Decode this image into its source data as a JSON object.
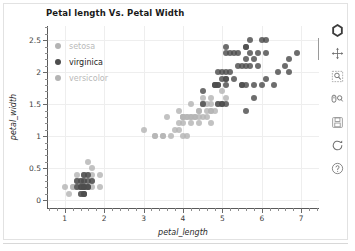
{
  "chart_data": {
    "type": "scatter",
    "title": "Petal length Vs. Petal Width",
    "xlabel": "petal_length",
    "ylabel": "petal_width",
    "xlim": [
      0.55,
      7.45
    ],
    "ylim": [
      -0.12,
      2.72
    ],
    "xticks": [
      1,
      2,
      3,
      4,
      5,
      6,
      7
    ],
    "yticks": [
      0,
      0.5,
      1,
      1.5,
      2,
      2.5
    ],
    "xticklabels": [
      "1",
      "2",
      "3",
      "4",
      "5",
      "6",
      "7"
    ],
    "yticklabels": [
      "0",
      "0.5",
      "1",
      "1.5",
      "2",
      "2.5"
    ],
    "grid": true,
    "legend_position": "upper-left",
    "series": [
      {
        "name": "setosa",
        "color": "#b4b4b4",
        "points": [
          [
            1.4,
            0.2
          ],
          [
            1.4,
            0.2
          ],
          [
            1.3,
            0.2
          ],
          [
            1.5,
            0.2
          ],
          [
            1.4,
            0.2
          ],
          [
            1.7,
            0.4
          ],
          [
            1.4,
            0.3
          ],
          [
            1.5,
            0.2
          ],
          [
            1.4,
            0.2
          ],
          [
            1.5,
            0.1
          ],
          [
            1.5,
            0.2
          ],
          [
            1.6,
            0.2
          ],
          [
            1.4,
            0.1
          ],
          [
            1.1,
            0.1
          ],
          [
            1.2,
            0.2
          ],
          [
            1.5,
            0.4
          ],
          [
            1.3,
            0.4
          ],
          [
            1.4,
            0.3
          ],
          [
            1.7,
            0.3
          ],
          [
            1.5,
            0.3
          ],
          [
            1.7,
            0.2
          ],
          [
            1.5,
            0.4
          ],
          [
            1.0,
            0.2
          ],
          [
            1.7,
            0.5
          ],
          [
            1.9,
            0.2
          ],
          [
            1.6,
            0.2
          ],
          [
            1.6,
            0.4
          ],
          [
            1.5,
            0.2
          ],
          [
            1.4,
            0.2
          ],
          [
            1.6,
            0.2
          ],
          [
            1.6,
            0.2
          ],
          [
            1.5,
            0.4
          ],
          [
            1.5,
            0.1
          ],
          [
            1.4,
            0.2
          ],
          [
            1.5,
            0.2
          ],
          [
            1.2,
            0.2
          ],
          [
            1.3,
            0.2
          ],
          [
            1.4,
            0.1
          ],
          [
            1.3,
            0.2
          ],
          [
            1.5,
            0.2
          ],
          [
            1.3,
            0.3
          ],
          [
            1.3,
            0.3
          ],
          [
            1.3,
            0.2
          ],
          [
            1.6,
            0.6
          ],
          [
            1.9,
            0.4
          ],
          [
            1.4,
            0.3
          ],
          [
            1.6,
            0.2
          ],
          [
            1.4,
            0.2
          ],
          [
            1.5,
            0.2
          ],
          [
            1.4,
            0.2
          ]
        ]
      },
      {
        "name": "versicolor",
        "color": "#b4b4b4",
        "points": [
          [
            4.7,
            1.4
          ],
          [
            4.5,
            1.5
          ],
          [
            4.9,
            1.5
          ],
          [
            4.0,
            1.3
          ],
          [
            4.6,
            1.5
          ],
          [
            4.5,
            1.3
          ],
          [
            4.7,
            1.6
          ],
          [
            3.3,
            1.0
          ],
          [
            4.6,
            1.3
          ],
          [
            3.9,
            1.4
          ],
          [
            3.5,
            1.0
          ],
          [
            4.2,
            1.5
          ],
          [
            4.0,
            1.0
          ],
          [
            4.7,
            1.4
          ],
          [
            3.6,
            1.3
          ],
          [
            4.4,
            1.4
          ],
          [
            4.5,
            1.5
          ],
          [
            4.1,
            1.0
          ],
          [
            4.5,
            1.5
          ],
          [
            3.9,
            1.1
          ],
          [
            4.8,
            1.8
          ],
          [
            4.0,
            1.3
          ],
          [
            4.9,
            1.5
          ],
          [
            4.7,
            1.2
          ],
          [
            4.3,
            1.3
          ],
          [
            4.4,
            1.4
          ],
          [
            4.8,
            1.4
          ],
          [
            5.0,
            1.7
          ],
          [
            4.5,
            1.5
          ],
          [
            3.5,
            1.0
          ],
          [
            3.8,
            1.1
          ],
          [
            3.7,
            1.0
          ],
          [
            3.9,
            1.2
          ],
          [
            5.1,
            1.6
          ],
          [
            4.5,
            1.5
          ],
          [
            4.5,
            1.6
          ],
          [
            4.7,
            1.5
          ],
          [
            4.4,
            1.3
          ],
          [
            4.1,
            1.3
          ],
          [
            4.0,
            1.3
          ],
          [
            4.4,
            1.2
          ],
          [
            4.6,
            1.4
          ],
          [
            4.0,
            1.2
          ],
          [
            3.3,
            1.0
          ],
          [
            4.2,
            1.3
          ],
          [
            4.2,
            1.2
          ],
          [
            4.2,
            1.3
          ],
          [
            4.3,
            1.3
          ],
          [
            3.0,
            1.1
          ],
          [
            4.1,
            1.3
          ]
        ]
      },
      {
        "name": "virginica",
        "color": "#4d4d4d",
        "points": [
          [
            6.0,
            2.5
          ],
          [
            5.1,
            1.9
          ],
          [
            5.9,
            2.1
          ],
          [
            5.6,
            1.8
          ],
          [
            5.8,
            2.2
          ],
          [
            6.6,
            2.1
          ],
          [
            4.5,
            1.7
          ],
          [
            6.3,
            1.8
          ],
          [
            5.8,
            1.8
          ],
          [
            6.1,
            2.5
          ],
          [
            5.1,
            2.0
          ],
          [
            5.3,
            1.9
          ],
          [
            5.5,
            2.1
          ],
          [
            5.0,
            2.0
          ],
          [
            5.1,
            2.4
          ],
          [
            5.3,
            2.3
          ],
          [
            5.5,
            1.8
          ],
          [
            6.7,
            2.2
          ],
          [
            6.9,
            2.3
          ],
          [
            5.0,
            1.5
          ],
          [
            5.7,
            2.3
          ],
          [
            4.9,
            2.0
          ],
          [
            6.7,
            2.0
          ],
          [
            4.9,
            1.8
          ],
          [
            5.7,
            2.1
          ],
          [
            6.0,
            1.8
          ],
          [
            4.8,
            1.8
          ],
          [
            4.9,
            1.8
          ],
          [
            5.6,
            2.1
          ],
          [
            5.8,
            1.6
          ],
          [
            6.1,
            1.9
          ],
          [
            6.4,
            2.0
          ],
          [
            5.6,
            2.2
          ],
          [
            5.1,
            1.5
          ],
          [
            5.6,
            1.4
          ],
          [
            6.1,
            2.3
          ],
          [
            5.6,
            2.4
          ],
          [
            5.5,
            1.8
          ],
          [
            4.8,
            1.8
          ],
          [
            5.4,
            2.1
          ],
          [
            5.6,
            2.4
          ],
          [
            5.1,
            2.3
          ],
          [
            5.1,
            1.9
          ],
          [
            5.9,
            2.3
          ],
          [
            5.7,
            2.5
          ],
          [
            5.2,
            2.3
          ],
          [
            5.0,
            1.9
          ],
          [
            5.2,
            2.0
          ],
          [
            5.4,
            2.3
          ],
          [
            5.1,
            1.8
          ],
          [
            1.5,
            0.2
          ],
          [
            1.4,
            0.2
          ],
          [
            1.5,
            0.3
          ],
          [
            1.6,
            0.2
          ],
          [
            1.4,
            0.1
          ],
          [
            1.5,
            0.1
          ],
          [
            1.3,
            0.3
          ],
          [
            1.5,
            0.4
          ],
          [
            1.6,
            0.3
          ],
          [
            1.4,
            0.2
          ],
          [
            1.3,
            0.2
          ],
          [
            1.5,
            0.2
          ],
          [
            1.7,
            0.3
          ],
          [
            1.5,
            0.1
          ],
          [
            1.6,
            0.4
          ],
          [
            1.4,
            0.3
          ],
          [
            1.5,
            0.2
          ],
          [
            1.6,
            0.2
          ],
          [
            4.5,
            1.5
          ],
          [
            5.0,
            1.5
          ],
          [
            4.9,
            1.5
          ]
        ]
      }
    ]
  },
  "legend": {
    "items": [
      {
        "label": "setosa",
        "color": "#b4b4b4",
        "text_color": "#b9b9b9"
      },
      {
        "label": "virginica",
        "color": "#4d4d4d",
        "text_color": "#1f1f1f"
      },
      {
        "label": "versicolor",
        "color": "#b4b4b4",
        "text_color": "#b9b9b9"
      }
    ]
  },
  "toolbar": {
    "tools": [
      {
        "name": "bokeh-logo-icon",
        "title": "Bokeh"
      },
      {
        "name": "pan-icon",
        "title": "Pan"
      },
      {
        "name": "box-zoom-icon",
        "title": "Box Zoom"
      },
      {
        "name": "wheel-zoom-icon",
        "title": "Wheel Zoom"
      },
      {
        "name": "save-icon",
        "title": "Save"
      },
      {
        "name": "reset-icon",
        "title": "Reset"
      },
      {
        "name": "help-icon",
        "title": "Help"
      }
    ]
  }
}
